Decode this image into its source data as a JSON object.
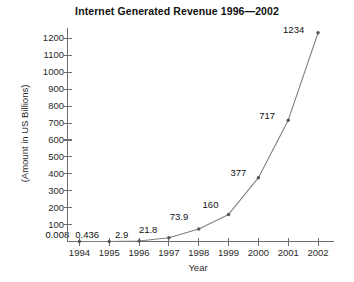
{
  "chart_data": {
    "type": "line",
    "title": "Internet Generated Revenue 1996—2002",
    "xlabel": "Year",
    "ylabel": "(Amount in US Billions)",
    "categories": [
      "1994",
      "1995",
      "1996",
      "1997",
      "1998",
      "1999",
      "2000",
      "2001",
      "2002"
    ],
    "x": [
      1994,
      1995,
      1996,
      1997,
      1998,
      1999,
      2000,
      2001,
      2002
    ],
    "values": [
      0.008,
      0.436,
      2.9,
      21.8,
      73.9,
      160,
      377,
      717,
      1234
    ],
    "point_labels": [
      "0.008",
      "0.436",
      "2.9",
      "21.8",
      "73.9",
      "160",
      "377",
      "717",
      "1234"
    ],
    "ylim": [
      0,
      1250
    ],
    "xlim": [
      1993.6,
      2002.4
    ],
    "yticks": [
      100,
      200,
      300,
      400,
      500,
      600,
      700,
      800,
      900,
      1000,
      1100,
      1200
    ],
    "ytick_labels": [
      "100",
      "200",
      "300",
      "400",
      "500",
      "600",
      "700",
      "800",
      "900",
      "1000",
      "1100",
      "1200"
    ],
    "grid": false,
    "legend": false,
    "legend_position": "none",
    "series": [
      {
        "name": "Internet Generated Revenue",
        "values": [
          0.008,
          0.436,
          2.9,
          21.8,
          73.9,
          160,
          377,
          717,
          1234
        ],
        "line_color": "#808080",
        "marker": "dot",
        "marker_color": "#555555"
      }
    ],
    "colors": {
      "axis": "#6e6e6e",
      "line": "#8a8a8a",
      "marker": "#4a4a4a",
      "text": "#1a1a1a",
      "background": "#ffffff"
    }
  }
}
